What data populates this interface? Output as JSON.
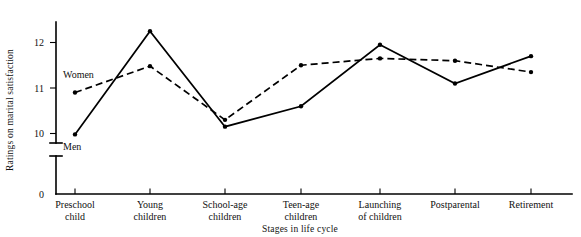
{
  "chart_data": {
    "type": "line",
    "title": "",
    "subtitle": "",
    "xlabel": "Stages in life cycle",
    "ylabel": "Ratings on marital satisfaction",
    "categories": [
      "Preschool child",
      "Young children",
      "School-age children",
      "Teen-age children",
      "Launching of children",
      "Postparental",
      "Retirement"
    ],
    "category_lines": [
      [
        "Preschool",
        "child"
      ],
      [
        "Young",
        "children"
      ],
      [
        "School-age",
        "children"
      ],
      [
        "Teen-age",
        "children"
      ],
      [
        "Launching",
        "of children"
      ],
      [
        "Postparental",
        ""
      ],
      [
        "Retirement",
        ""
      ]
    ],
    "series": [
      {
        "name": "Men",
        "style": "solid",
        "values": [
          9.98,
          12.25,
          10.15,
          10.6,
          11.95,
          11.1,
          11.7
        ]
      },
      {
        "name": "Women",
        "style": "dashed",
        "values": [
          10.9,
          11.48,
          10.3,
          11.5,
          11.65,
          11.6,
          11.35
        ]
      }
    ],
    "ylim": [
      9.55,
      12.55
    ],
    "yticks": [
      10,
      11,
      12
    ],
    "ytick_labels": [
      "10",
      "11",
      "12"
    ],
    "y_origin_label": "0",
    "axis_break": true,
    "grid": false,
    "legend_position": "inline-annotations",
    "annotations": [
      {
        "text": "Women",
        "series": "Women"
      },
      {
        "text": "Men",
        "series": "Men"
      }
    ],
    "colors": {
      "line": "#000000",
      "background": "#ffffff",
      "text": "#111111"
    }
  }
}
